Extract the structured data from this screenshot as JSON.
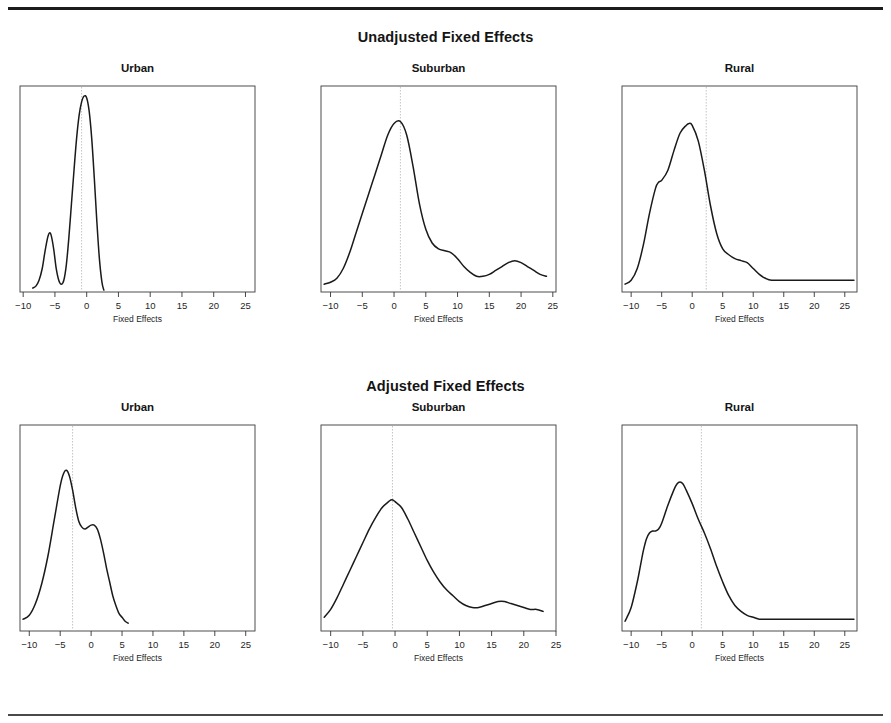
{
  "figure": {
    "sections": [
      {
        "title": "Unadjusted Fixed Effects"
      },
      {
        "title": "Adjusted Fixed Effects"
      }
    ],
    "panel_titles": [
      "Urban",
      "Suburban",
      "Rural"
    ],
    "axis_title": "Fixed Effects",
    "tick_labels": [
      "−10",
      "−5",
      "0",
      "5",
      "10",
      "15",
      "20",
      "25"
    ],
    "line_color": "#1a1a1a",
    "refline_color": "#bdbdbd",
    "frame_color": "#3a3a3a"
  },
  "chart_data": [
    {
      "type": "line",
      "title": "Urban",
      "section": "Unadjusted Fixed Effects",
      "xlabel": "Fixed Effects",
      "ylabel": "Density",
      "xlim": [
        -10.5,
        26.5
      ],
      "ylim": [
        0,
        1
      ],
      "xticks": [
        -10,
        -5,
        0,
        5,
        10,
        15,
        20,
        25
      ],
      "grid": false,
      "reference_line_x": -0.8,
      "curve_x": [
        -8.5,
        -8.0,
        -7.5,
        -7.0,
        -6.6,
        -6.2,
        -5.9,
        -5.6,
        -5.2,
        -4.8,
        -4.4,
        -4.0,
        -3.6,
        -3.2,
        -2.8,
        -2.4,
        -2.0,
        -1.6,
        -1.2,
        -0.8,
        -0.4,
        0.0,
        0.4,
        0.8,
        1.2,
        1.6,
        2.0,
        2.4,
        2.7
      ],
      "curve_y": [
        0.02,
        0.03,
        0.06,
        0.12,
        0.2,
        0.27,
        0.3,
        0.29,
        0.22,
        0.12,
        0.06,
        0.04,
        0.06,
        0.14,
        0.28,
        0.45,
        0.62,
        0.78,
        0.9,
        0.97,
        1.0,
        0.99,
        0.92,
        0.78,
        0.58,
        0.36,
        0.17,
        0.05,
        0.01
      ]
    },
    {
      "type": "line",
      "title": "Suburban",
      "section": "Unadjusted Fixed Effects",
      "xlabel": "Fixed Effects",
      "ylabel": "Density",
      "xlim": [
        -11.5,
        25.5
      ],
      "ylim": [
        0,
        1
      ],
      "xticks": [
        -10,
        -5,
        0,
        5,
        10,
        15,
        20,
        25
      ],
      "grid": false,
      "reference_line_x": 1.0,
      "curve_x": [
        -11.0,
        -10.0,
        -9.0,
        -8.0,
        -7.0,
        -6.0,
        -5.0,
        -4.0,
        -3.0,
        -2.0,
        -1.0,
        0.0,
        1.0,
        2.0,
        3.0,
        4.0,
        5.0,
        6.0,
        7.0,
        8.0,
        9.0,
        10.0,
        11.0,
        12.0,
        13.0,
        14.0,
        15.0,
        16.0,
        17.0,
        18.0,
        19.0,
        20.0,
        21.0,
        22.0,
        23.0,
        24.0
      ],
      "curve_y": [
        0.04,
        0.05,
        0.07,
        0.12,
        0.2,
        0.3,
        0.4,
        0.5,
        0.6,
        0.7,
        0.8,
        0.86,
        0.87,
        0.8,
        0.64,
        0.45,
        0.32,
        0.25,
        0.22,
        0.21,
        0.2,
        0.17,
        0.13,
        0.1,
        0.08,
        0.08,
        0.09,
        0.11,
        0.13,
        0.15,
        0.16,
        0.15,
        0.13,
        0.11,
        0.09,
        0.08
      ]
    },
    {
      "type": "line",
      "title": "Rural",
      "section": "Unadjusted Fixed Effects",
      "xlabel": "Fixed Effects",
      "ylabel": "Density",
      "xlim": [
        -11.5,
        27.0
      ],
      "ylim": [
        0,
        1
      ],
      "xticks": [
        -10,
        -5,
        0,
        5,
        10,
        15,
        20,
        25
      ],
      "grid": false,
      "reference_line_x": 2.3,
      "curve_x": [
        -11.0,
        -10.0,
        -9.0,
        -8.0,
        -7.0,
        -6.0,
        -5.5,
        -5.0,
        -4.0,
        -3.0,
        -2.0,
        -1.0,
        -0.5,
        0.0,
        1.0,
        2.0,
        3.0,
        4.0,
        5.0,
        6.0,
        7.0,
        8.0,
        9.0,
        10.0,
        11.0,
        12.0,
        13.0,
        15.0,
        18.0,
        21.0,
        24.0,
        26.5
      ],
      "curve_y": [
        0.04,
        0.06,
        0.12,
        0.24,
        0.4,
        0.53,
        0.56,
        0.57,
        0.62,
        0.72,
        0.81,
        0.85,
        0.86,
        0.85,
        0.77,
        0.62,
        0.44,
        0.3,
        0.22,
        0.19,
        0.17,
        0.16,
        0.15,
        0.12,
        0.09,
        0.07,
        0.06,
        0.06,
        0.06,
        0.06,
        0.06,
        0.06
      ]
    },
    {
      "type": "line",
      "title": "Urban",
      "section": "Adjusted Fixed Effects",
      "xlabel": "Fixed Effects",
      "ylabel": "Density",
      "xlim": [
        -11.5,
        26.5
      ],
      "ylim": [
        0,
        1
      ],
      "xticks": [
        -10,
        -5,
        0,
        5,
        10,
        15,
        20,
        25
      ],
      "grid": false,
      "reference_line_x": -3.0,
      "curve_x": [
        -11.0,
        -10.0,
        -9.0,
        -8.0,
        -7.0,
        -6.0,
        -5.0,
        -4.5,
        -4.0,
        -3.5,
        -3.0,
        -2.5,
        -2.0,
        -1.5,
        -1.0,
        -0.5,
        0.0,
        0.5,
        1.0,
        1.5,
        2.0,
        2.5,
        3.0,
        3.5,
        4.0,
        4.5,
        5.0,
        5.5,
        6.0
      ],
      "curve_y": [
        0.06,
        0.08,
        0.14,
        0.24,
        0.38,
        0.56,
        0.74,
        0.8,
        0.82,
        0.79,
        0.72,
        0.63,
        0.56,
        0.53,
        0.52,
        0.53,
        0.54,
        0.54,
        0.52,
        0.47,
        0.4,
        0.32,
        0.25,
        0.18,
        0.13,
        0.09,
        0.07,
        0.05,
        0.04
      ]
    },
    {
      "type": "line",
      "title": "Suburban",
      "section": "Adjusted Fixed Effects",
      "xlabel": "Fixed Effects",
      "ylabel": "Density",
      "xlim": [
        -11.5,
        25.0
      ],
      "ylim": [
        0,
        1
      ],
      "xticks": [
        -10,
        -5,
        0,
        5,
        10,
        15,
        20,
        25
      ],
      "grid": false,
      "reference_line_x": -0.4,
      "curve_x": [
        -11.0,
        -10.0,
        -9.0,
        -8.0,
        -7.0,
        -6.0,
        -5.0,
        -4.0,
        -3.0,
        -2.0,
        -1.0,
        -0.5,
        0.0,
        1.0,
        2.0,
        3.0,
        4.0,
        5.0,
        6.0,
        7.0,
        8.0,
        9.0,
        10.0,
        11.0,
        12.0,
        13.0,
        14.0,
        15.0,
        16.0,
        17.0,
        18.0,
        19.0,
        20.0,
        21.0,
        22.0,
        23.0
      ],
      "curve_y": [
        0.07,
        0.11,
        0.17,
        0.24,
        0.31,
        0.38,
        0.45,
        0.52,
        0.58,
        0.63,
        0.66,
        0.67,
        0.66,
        0.63,
        0.57,
        0.5,
        0.43,
        0.36,
        0.3,
        0.25,
        0.21,
        0.18,
        0.15,
        0.13,
        0.12,
        0.12,
        0.13,
        0.14,
        0.15,
        0.15,
        0.14,
        0.13,
        0.12,
        0.11,
        0.11,
        0.1
      ]
    },
    {
      "type": "line",
      "title": "Rural",
      "section": "Adjusted Fixed Effects",
      "xlabel": "Fixed Effects",
      "ylabel": "Density",
      "xlim": [
        -11.5,
        27.0
      ],
      "ylim": [
        0,
        1
      ],
      "xticks": [
        -10,
        -5,
        0,
        5,
        10,
        15,
        20,
        25
      ],
      "grid": false,
      "reference_line_x": 1.5,
      "curve_x": [
        -11.0,
        -10.0,
        -9.0,
        -8.5,
        -8.0,
        -7.5,
        -7.0,
        -6.5,
        -6.0,
        -5.5,
        -5.0,
        -4.0,
        -3.0,
        -2.5,
        -2.0,
        -1.5,
        -1.0,
        0.0,
        1.0,
        2.0,
        3.0,
        4.0,
        5.0,
        6.0,
        7.0,
        8.0,
        9.0,
        10.0,
        11.0,
        12.0,
        14.0,
        17.0,
        20.0,
        23.0,
        26.5
      ],
      "curve_y": [
        0.05,
        0.12,
        0.25,
        0.33,
        0.41,
        0.47,
        0.5,
        0.51,
        0.51,
        0.52,
        0.55,
        0.64,
        0.72,
        0.75,
        0.76,
        0.75,
        0.72,
        0.65,
        0.57,
        0.5,
        0.42,
        0.33,
        0.25,
        0.18,
        0.13,
        0.1,
        0.08,
        0.07,
        0.06,
        0.06,
        0.06,
        0.06,
        0.06,
        0.06,
        0.06
      ]
    }
  ]
}
